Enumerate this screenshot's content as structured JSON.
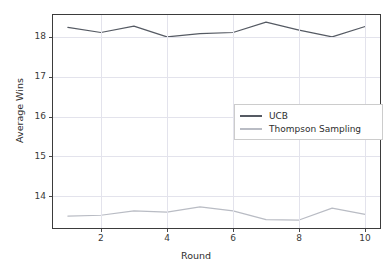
{
  "chart_data": {
    "type": "line",
    "title": "",
    "xlabel": "Round",
    "ylabel": "Average Wins",
    "x": [
      1,
      2,
      3,
      4,
      5,
      6,
      7,
      8,
      9,
      10
    ],
    "xlim": [
      0.55,
      10.45
    ],
    "ylim": [
      13.2,
      18.55
    ],
    "xticks": [
      2,
      4,
      6,
      8,
      10
    ],
    "xtick_labels": [
      "2",
      "4",
      "6",
      "8",
      "10"
    ],
    "yticks": [
      14,
      15,
      16,
      17,
      18
    ],
    "ytick_labels": [
      "14",
      "15",
      "16",
      "17",
      "18"
    ],
    "grid": true,
    "legend_position": "center-right",
    "series": [
      {
        "name": "UCB",
        "color": "#555a63",
        "values": [
          18.24,
          18.11,
          18.27,
          18.0,
          18.08,
          18.11,
          18.37,
          18.17,
          18.0,
          18.26
        ]
      },
      {
        "name": "Thompson Sampling",
        "color": "#b9bcc4",
        "values": [
          13.5,
          13.52,
          13.63,
          13.6,
          13.73,
          13.63,
          13.41,
          13.4,
          13.7,
          13.54
        ]
      }
    ]
  },
  "legend": {
    "items": [
      {
        "label": "UCB",
        "color": "#555a63"
      },
      {
        "label": "Thompson Sampling",
        "color": "#b9bcc4"
      }
    ]
  },
  "axes": {
    "x_title": "Round",
    "y_title": "Average Wins"
  }
}
